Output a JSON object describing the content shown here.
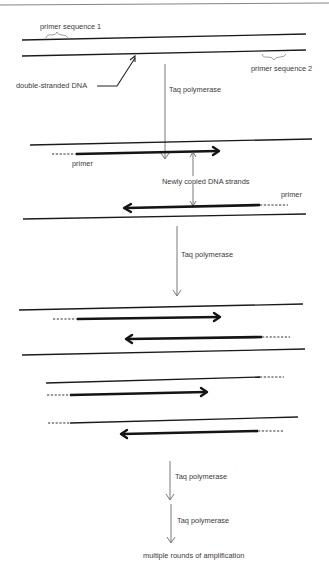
{
  "diagram": {
    "labels": {
      "primer_sequence_1": "primer sequence 1",
      "primer_sequence_2": "primer sequence 2",
      "double_stranded_dna": "double-stranded DNA",
      "taq_1": "Taq polymerase",
      "primer_left": "primer",
      "newly_copied": "Newly copied DNA strands",
      "primer_right": "primer",
      "taq_2": "Taq polymerase",
      "taq_3": "Taq polymerase",
      "taq_4": "Taq polymerase",
      "final": "multiple rounds of amplification"
    },
    "stages": [
      {
        "name": "original-dna",
        "description": "double-stranded DNA with two primer sequences"
      },
      {
        "name": "first-copy",
        "description": "primers extended into newly copied DNA strands"
      },
      {
        "name": "second-cycle",
        "description": "two double-stranded products each being copied"
      },
      {
        "name": "amplification",
        "description": "multiple rounds of amplification"
      }
    ],
    "colors": {
      "ink": "#1a1a1a",
      "label": "#3a3a3a",
      "background": "#ffffff"
    }
  }
}
